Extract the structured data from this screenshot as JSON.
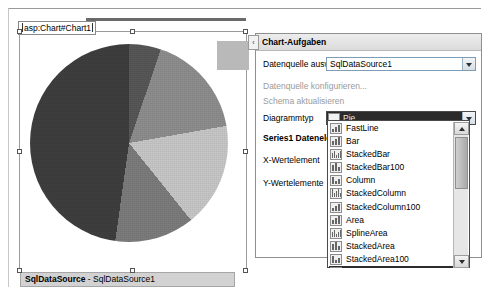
{
  "designer": {
    "tag_label": "asp:Chart#Chart1",
    "datasource_strip": {
      "name": "SqlDataSource",
      "separator": " - ",
      "id": "SqlDataSource1"
    }
  },
  "chart_data": {
    "type": "pie",
    "title": "",
    "categories": [
      "Segment 1",
      "Segment 2",
      "Segment 3",
      "Segment 4",
      "Segment 5",
      "Segment 6"
    ],
    "values": [
      19,
      14,
      17,
      17,
      13,
      20
    ],
    "colors": [
      "#cfcfcf",
      "#585858",
      "#8f8f8f",
      "#c9c9c9",
      "#7d7d7d",
      "#3f3f3f"
    ],
    "legend": "none",
    "grid": false
  },
  "panel": {
    "header": "Chart-Aufgaben",
    "collapse_icon": "‹",
    "datasource_row": {
      "label": "Datenquelle auswählen:",
      "value": "SqlDataSource1"
    },
    "links": [
      "Datenquelle konfigurieren...",
      "Schema aktualisieren"
    ],
    "charttype_row": {
      "label": "Diagrammtyp",
      "value": "Pie",
      "icon": "pie-icon"
    },
    "series_label": "Series1 Datenelement",
    "fields": [
      "X-Wertelement",
      "Y-Wertelemente"
    ]
  },
  "dropdown": {
    "items": [
      {
        "label": "FastLine",
        "icon": "fastline-icon"
      },
      {
        "label": "Bar",
        "icon": "bar-icon"
      },
      {
        "label": "StackedBar",
        "icon": "stackedbar-icon"
      },
      {
        "label": "StackedBar100",
        "icon": "stackedbar100-icon"
      },
      {
        "label": "Column",
        "icon": "column-icon"
      },
      {
        "label": "StackedColumn",
        "icon": "stackedcolumn-icon"
      },
      {
        "label": "StackedColumn100",
        "icon": "stackedcolumn100-icon"
      },
      {
        "label": "Area",
        "icon": "area-icon"
      },
      {
        "label": "SplineArea",
        "icon": "splinearea-icon"
      },
      {
        "label": "StackedArea",
        "icon": "stackedarea-icon"
      },
      {
        "label": "StackedArea100",
        "icon": "stackedarea100-icon"
      },
      {
        "label": "Pie",
        "icon": "pie-icon",
        "selected": true
      }
    ]
  },
  "colors": {
    "selection_dark": "#2b2b2b",
    "panel_header_bg": "#e6e6e7",
    "strip_bg": "#d2d2d2"
  }
}
